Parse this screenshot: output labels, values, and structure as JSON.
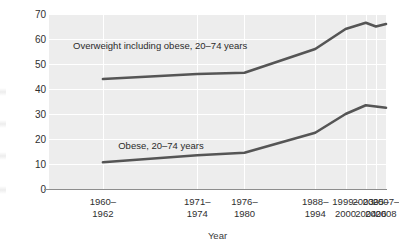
{
  "chart_data": {
    "type": "line",
    "title": "",
    "xlabel": "Year",
    "ylabel": "Percent",
    "ylim": [
      0,
      70
    ],
    "yticks": [
      0,
      10,
      20,
      30,
      40,
      50,
      60,
      70
    ],
    "grid": true,
    "legend_position": "inline-annotations",
    "categories": [
      "1960–1962",
      "1971–1974",
      "1976–1980",
      "1988–1994",
      "1999–2000",
      "2003–2004",
      "2005–2006",
      "2007–2008"
    ],
    "category_lines": [
      [
        "1960–",
        "1962"
      ],
      [
        "1971–",
        "1974"
      ],
      [
        "1976–",
        "1980"
      ],
      [
        "1988–",
        "1994"
      ],
      [
        "1999–",
        "2000"
      ],
      [
        "2003–",
        "2004"
      ],
      [
        "2005–",
        "2006"
      ],
      [
        "2007–",
        "2008"
      ]
    ],
    "category_positions": [
      16,
      44,
      58,
      79,
      88,
      94,
      97,
      100
    ],
    "series": [
      {
        "name": "Overweight including obese, 20–74 years",
        "color": "#555555",
        "values": [
          44.0,
          46.0,
          46.5,
          56.0,
          64.0,
          66.5,
          65.0,
          66.0
        ],
        "annotation_lines": [
          "Overweight including obese,",
          "20–74 years"
        ]
      },
      {
        "name": "Obese, 20–74 years",
        "color": "#555555",
        "values": [
          10.7,
          13.5,
          14.5,
          22.5,
          30.0,
          33.5,
          33.0,
          32.5
        ],
        "annotation_lines": [
          "Obese, 20–74 years"
        ]
      }
    ]
  },
  "style": {
    "plot_background": "#ededed",
    "gridline_color": "#ffffff",
    "line_color": "#555555",
    "axis_color": "#8d8d8d",
    "text_color": "#2f2f2f"
  }
}
